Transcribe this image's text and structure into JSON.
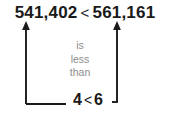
{
  "figure": {
    "background_color": "#ffffff",
    "line_color": "#1a1a1a",
    "text_color": "#1a1a1a",
    "muted_text_color": "#8d8d8d"
  },
  "top_comparison": {
    "left_number": "541,402",
    "operator": "<",
    "right_number": "561,161",
    "full_text": "541,402 < 561,161"
  },
  "annotation": {
    "line1": "is",
    "line2": "less",
    "line3": "than"
  },
  "bottom_comparison": {
    "left_digit": "4",
    "operator": "<",
    "right_digit": "6",
    "full_text": "4 < 6"
  }
}
